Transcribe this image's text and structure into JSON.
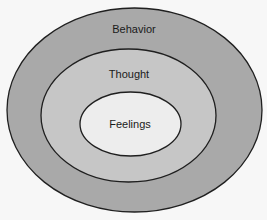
{
  "diagram": {
    "type": "nested-ellipses",
    "layers": [
      {
        "id": "behavior",
        "label": "Behavior",
        "fill": "#a9a9a9",
        "stroke": "#1f1f1f",
        "cx": 134.5,
        "cy": 110,
        "rx": 127.5,
        "ry": 102,
        "label_x": 134,
        "label_y": 33
      },
      {
        "id": "thought",
        "label": "Thought",
        "fill": "#c6c6c6",
        "stroke": "#1f1f1f",
        "cx": 128.5,
        "cy": 115.5,
        "rx": 87.5,
        "ry": 66.5,
        "label_x": 129,
        "label_y": 78
      },
      {
        "id": "feelings",
        "label": "Feelings",
        "fill": "#ededed",
        "stroke": "#1f1f1f",
        "cx": 130.5,
        "cy": 124,
        "rx": 50.5,
        "ry": 32,
        "label_x": 130,
        "label_y": 128
      }
    ],
    "background": "#f7f7f7"
  }
}
